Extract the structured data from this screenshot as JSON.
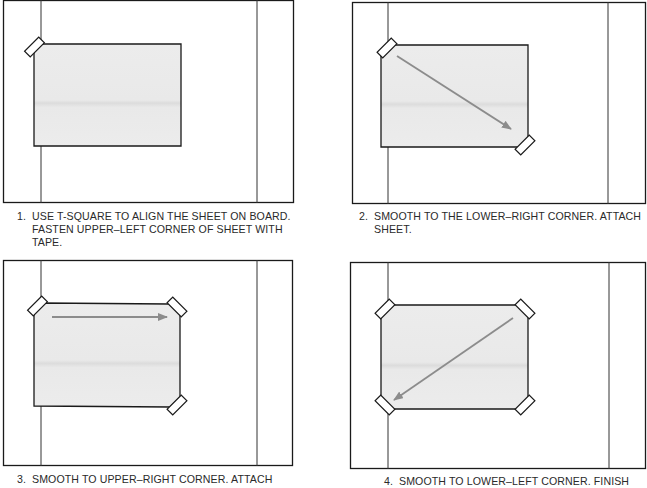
{
  "figure": {
    "colors": {
      "board_stroke": "#1a1a1a",
      "sheet_fill": "#e8e8e8",
      "sheet_stroke": "#1a1a1a",
      "arrow": "#8c8c8c",
      "tape_fill": "#ffffff",
      "text": "#2a2a2a"
    },
    "steps": [
      {
        "number": "1.",
        "text": "USE T-SQUARE TO ALIGN THE SHEET ON BOARD.\nFASTEN UPPER–LEFT CORNER OF SHEET WITH\nTAPE.",
        "tapes": [
          "upper-left"
        ],
        "arrow": "none"
      },
      {
        "number": "2.",
        "text": "SMOOTH TO THE LOWER–RIGHT CORNER. ATTACH\nSHEET.",
        "tapes": [
          "upper-left",
          "lower-right"
        ],
        "arrow": "upper-left to lower-right"
      },
      {
        "number": "3.",
        "text": "SMOOTH TO UPPER–RIGHT CORNER. ATTACH",
        "tapes": [
          "upper-left",
          "upper-right",
          "lower-right"
        ],
        "arrow": "left to right"
      },
      {
        "number": "4.",
        "text": "SMOOTH TO LOWER–LEFT CORNER. FINISH",
        "tapes": [
          "upper-left",
          "upper-right",
          "lower-left",
          "lower-right"
        ],
        "arrow": "upper-right to lower-left"
      }
    ]
  }
}
